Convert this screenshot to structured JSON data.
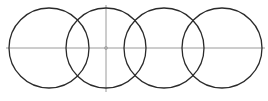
{
  "diagram": {
    "colors": {
      "background": "#ffffff",
      "circle_stroke": "#2a2a2a",
      "axis_line": "#9a9a9a"
    },
    "circles": [
      {
        "cx": 49,
        "cy": 48,
        "r": 40
      },
      {
        "cx": 106,
        "cy": 48,
        "r": 40
      },
      {
        "cx": 164,
        "cy": 48,
        "r": 40
      },
      {
        "cx": 222,
        "cy": 48,
        "r": 40
      }
    ],
    "horizontal_line": {
      "x1": 6,
      "y1": 48,
      "x2": 265,
      "y2": 48
    },
    "vertical_line": {
      "x1": 106,
      "y1": 5,
      "x2": 106,
      "y2": 92
    },
    "center_mark": {
      "cx": 106,
      "cy": 48,
      "r": 1.5
    }
  }
}
